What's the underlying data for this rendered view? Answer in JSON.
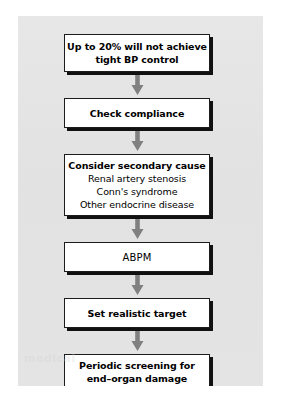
{
  "diagram": {
    "type": "flowchart",
    "orientation": "vertical",
    "panel_color": "#e4e4e4",
    "page_color": "#ffffff",
    "box_fill": "#ffffff",
    "box_border_color": "#1c1c1c",
    "box_shadow_color": "#111111",
    "arrow_color": "#808080",
    "text_color": "#000000",
    "watermark_text": "medical",
    "nodes": [
      {
        "id": "node-0",
        "name": "up-to-20-percent-will-not-achieve-tight-bp-control",
        "lines": [
          {
            "text": "Up to 20% will not achieve",
            "style": "strong"
          },
          {
            "text": "tight BP control",
            "style": "strong"
          }
        ]
      },
      {
        "id": "node-1",
        "name": "check-compliance",
        "lines": [
          {
            "text": "Check compliance",
            "style": "strong"
          }
        ]
      },
      {
        "id": "node-2",
        "name": "consider-secondary-cause",
        "lines": [
          {
            "text": "Consider secondary cause",
            "style": "strong"
          },
          {
            "text": "Renal artery stenosis",
            "style": "normal"
          },
          {
            "text": "Conn's syndrome",
            "style": "normal"
          },
          {
            "text": "Other endocrine disease",
            "style": "normal"
          }
        ]
      },
      {
        "id": "node-3",
        "name": "abpm",
        "lines": [
          {
            "text": "ABPM",
            "style": "plain"
          }
        ]
      },
      {
        "id": "node-4",
        "name": "set-realistic-target",
        "lines": [
          {
            "text": "Set realistic target",
            "style": "strong"
          }
        ]
      },
      {
        "id": "node-5",
        "name": "periodic-screening-for-end-organ-damage",
        "lines": [
          {
            "text": "Periodic screening for",
            "style": "strong"
          },
          {
            "text": "end–organ damage",
            "style": "strong"
          }
        ]
      }
    ],
    "arrows": [
      {
        "id": "arrow-0",
        "from": "node-0",
        "to": "node-1",
        "direction": "down"
      },
      {
        "id": "arrow-1",
        "from": "node-1",
        "to": "node-2",
        "direction": "down"
      },
      {
        "id": "arrow-2",
        "from": "node-2",
        "to": "node-3",
        "direction": "down"
      },
      {
        "id": "arrow-3",
        "from": "node-3",
        "to": "node-4",
        "direction": "down"
      },
      {
        "id": "arrow-4",
        "from": "node-4",
        "to": "node-5",
        "direction": "down"
      }
    ]
  }
}
